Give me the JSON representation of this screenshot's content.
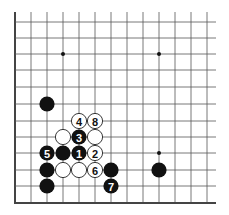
{
  "diagram": {
    "type": "go-board-fragment",
    "columns_x": [
      15,
      31,
      47,
      63,
      79,
      95,
      111,
      127,
      143,
      159,
      175,
      191,
      207
    ],
    "rows_y": [
      13,
      22,
      38,
      54,
      70,
      87,
      104,
      121,
      137,
      153,
      170,
      186
    ],
    "left_edge_x": 15,
    "bottom_edge_y": 203,
    "right_clip_x": 216,
    "star_points": [
      [
        63,
        54
      ],
      [
        159,
        54
      ],
      [
        159,
        153
      ]
    ],
    "stones": [
      {
        "color": "black",
        "x": 47,
        "y": 104,
        "label": ""
      },
      {
        "color": "white",
        "x": 79,
        "y": 121,
        "label": "4"
      },
      {
        "color": "white",
        "x": 95,
        "y": 121,
        "label": "8"
      },
      {
        "color": "white",
        "x": 63,
        "y": 137,
        "label": ""
      },
      {
        "color": "black",
        "x": 79,
        "y": 137,
        "label": "3"
      },
      {
        "color": "white",
        "x": 95,
        "y": 137,
        "label": ""
      },
      {
        "color": "black",
        "x": 47,
        "y": 153,
        "label": "5"
      },
      {
        "color": "black",
        "x": 63,
        "y": 153,
        "label": ""
      },
      {
        "color": "black",
        "x": 79,
        "y": 153,
        "label": "1"
      },
      {
        "color": "white",
        "x": 95,
        "y": 153,
        "label": "2"
      },
      {
        "color": "black",
        "x": 47,
        "y": 170,
        "label": ""
      },
      {
        "color": "white",
        "x": 63,
        "y": 170,
        "label": ""
      },
      {
        "color": "white",
        "x": 79,
        "y": 170,
        "label": ""
      },
      {
        "color": "white",
        "x": 95,
        "y": 170,
        "label": "6"
      },
      {
        "color": "black",
        "x": 111,
        "y": 170,
        "label": ""
      },
      {
        "color": "black",
        "x": 159,
        "y": 170,
        "label": ""
      },
      {
        "color": "black",
        "x": 47,
        "y": 186,
        "label": ""
      },
      {
        "color": "black",
        "x": 111,
        "y": 186,
        "label": "7"
      }
    ],
    "colors": {
      "line": "#555555",
      "edge": "#444444",
      "black": "#111111",
      "white": "#ffffff"
    }
  }
}
